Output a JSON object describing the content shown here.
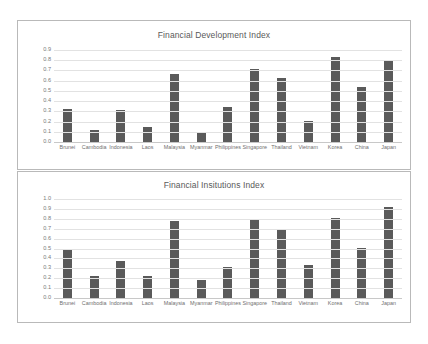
{
  "document": {
    "background_color": "#ffffff",
    "panel_border_color": "#b9b9b9",
    "bar_color": "#5a5a5a",
    "gridline_color": "#e2e2e2",
    "text_color": "#595959"
  },
  "chart_data": [
    {
      "type": "bar",
      "title": "Financial Development Index",
      "xlabel": "",
      "ylabel": "",
      "ylim": [
        0.0,
        0.9
      ],
      "grid": true,
      "legend": "none",
      "yticks": [
        "0.9",
        "0.8",
        "0.7",
        "0.6",
        "0.5",
        "0.4",
        "0.3",
        "0.2",
        "0.1",
        "0.0"
      ],
      "categories": [
        "Brunei",
        "Cambodia",
        "Indonesia",
        "Laos",
        "Malaysia",
        "Myanmar",
        "Philippines",
        "Singapore",
        "Thailand",
        "Vietnam",
        "Korea",
        "China",
        "Japan"
      ],
      "values": [
        0.32,
        0.12,
        0.31,
        0.15,
        0.67,
        0.09,
        0.34,
        0.71,
        0.63,
        0.21,
        0.83,
        0.54,
        0.8
      ]
    },
    {
      "type": "bar",
      "title": "Financial Insitutions Index",
      "xlabel": "",
      "ylabel": "",
      "ylim": [
        0.0,
        1.0
      ],
      "grid": true,
      "legend": "none",
      "yticks": [
        "1.0",
        "0.9",
        "0.8",
        "0.7",
        "0.6",
        "0.5",
        "0.4",
        "0.3",
        "0.2",
        "0.1",
        "0.0"
      ],
      "categories": [
        "Brunei",
        "Cambodia",
        "Indonesia",
        "Laos",
        "Malaysia",
        "Myanmar",
        "Philippines",
        "Singapore",
        "Thailand",
        "Vietnam",
        "Korea",
        "China",
        "Japan"
      ],
      "values": [
        0.48,
        0.22,
        0.37,
        0.22,
        0.78,
        0.18,
        0.31,
        0.8,
        0.7,
        0.33,
        0.81,
        0.51,
        0.92
      ]
    }
  ]
}
